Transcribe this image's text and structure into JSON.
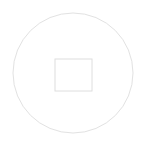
{
  "canvas": {
    "width": 146,
    "height": 146,
    "background_color": "#ffffff",
    "title": "Circle with inscribed square"
  },
  "shapes": {
    "circle": {
      "name": "outer circle",
      "center_x": 73,
      "center_y": 73,
      "radius": 60,
      "stroke_color": "#e2e2e2",
      "stroke_width": 1,
      "fill": "none"
    },
    "square": {
      "name": "inner square",
      "x": 55,
      "y": 59,
      "width": 37,
      "height": 32,
      "stroke_color": "#dedede",
      "stroke_width": 1,
      "fill": "none"
    }
  }
}
